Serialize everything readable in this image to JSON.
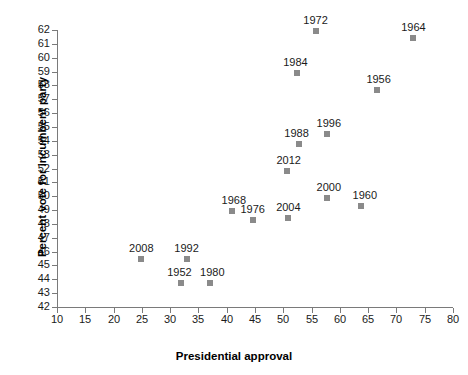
{
  "chart_data": {
    "type": "scatter",
    "title": "",
    "xlabel": "Presidential approval",
    "ylabel": "Percent vote for incumbent party",
    "xlim": [
      10,
      80
    ],
    "ylim": [
      42,
      62
    ],
    "xticks": [
      10,
      15,
      20,
      25,
      30,
      35,
      40,
      45,
      50,
      55,
      60,
      65,
      70,
      75,
      80
    ],
    "yticks": [
      42,
      43,
      44,
      45,
      46,
      47,
      48,
      49,
      50,
      51,
      52,
      53,
      54,
      55,
      56,
      57,
      58,
      59,
      60,
      61,
      62
    ],
    "grid": false,
    "legend": false,
    "marker_color": "#8a8a8a",
    "axis_color": "#7a7a7a",
    "points": [
      {
        "label": "1964",
        "x": 73.0,
        "y": 61.4,
        "lx": 0,
        "ly": -16
      },
      {
        "label": "1972",
        "x": 55.7,
        "y": 61.9,
        "lx": 0,
        "ly": -16
      },
      {
        "label": "1984",
        "x": 52.5,
        "y": 58.9,
        "lx": -2,
        "ly": -16
      },
      {
        "label": "1956",
        "x": 66.5,
        "y": 57.7,
        "lx": 2,
        "ly": -16
      },
      {
        "label": "1996",
        "x": 57.7,
        "y": 54.5,
        "lx": 2,
        "ly": -16
      },
      {
        "label": "1988",
        "x": 52.7,
        "y": 53.8,
        "lx": -2,
        "ly": -16
      },
      {
        "label": "2012",
        "x": 50.6,
        "y": 51.8,
        "lx": 2,
        "ly": -16
      },
      {
        "label": "2000",
        "x": 57.7,
        "y": 49.9,
        "lx": 2,
        "ly": -16
      },
      {
        "label": "1960",
        "x": 63.7,
        "y": 49.3,
        "lx": 4,
        "ly": -16
      },
      {
        "label": "1968",
        "x": 40.9,
        "y": 48.9,
        "lx": 2,
        "ly": -16
      },
      {
        "label": "1976",
        "x": 44.6,
        "y": 48.3,
        "lx": 0,
        "ly": -16
      },
      {
        "label": "2004",
        "x": 50.9,
        "y": 48.4,
        "lx": 0,
        "ly": -16
      },
      {
        "label": "2008",
        "x": 24.9,
        "y": 45.5,
        "lx": 0,
        "ly": -16
      },
      {
        "label": "1992",
        "x": 32.9,
        "y": 45.5,
        "lx": 0,
        "ly": -16
      },
      {
        "label": "1952",
        "x": 32.0,
        "y": 43.7,
        "lx": -2,
        "ly": -16
      },
      {
        "label": "1980",
        "x": 37.1,
        "y": 43.7,
        "lx": 2,
        "ly": -16
      }
    ]
  }
}
